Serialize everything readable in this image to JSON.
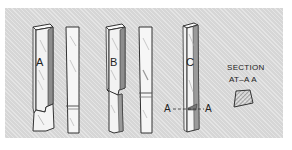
{
  "figure": {
    "tools": [
      {
        "id": "A",
        "label": "A",
        "description": "Ground tool bit with side relief at lower end"
      },
      {
        "id": "A2",
        "label": "",
        "description": "Blank bit with ground line near bottom"
      },
      {
        "id": "B",
        "label": "B",
        "description": "Tool bit with shoulder ground at lower end"
      },
      {
        "id": "B2",
        "label": "",
        "description": "Blank bit with marked line near bottom"
      },
      {
        "id": "C",
        "label": "C",
        "description": "Tool bit with section line A-A"
      }
    ],
    "section_line": {
      "left_label": "A",
      "right_label": "A"
    },
    "section_caption": {
      "line1": "SECTION",
      "line2": "AT–A A"
    }
  },
  "colors": {
    "background": "#d6d6d6",
    "outline": "#333333",
    "face": "#f4f4f4",
    "shade": "#8a8a8a"
  }
}
